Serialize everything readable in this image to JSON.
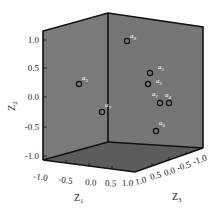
{
  "chart_data": {
    "type": "scatter",
    "subtype": "3d-scatter",
    "title": "",
    "axes": {
      "x": {
        "label": "Z1",
        "label_main": "Z",
        "label_sub": "1",
        "ticks": [
          "-1.0",
          "-0.5",
          "0.0",
          "0.5",
          "1.0"
        ],
        "range": [
          -1.0,
          1.0
        ]
      },
      "y": {
        "label": "Z2",
        "label_main": "Z",
        "label_sub": "2",
        "ticks": [
          "1.0",
          "0.5",
          "0.0",
          "-0.5",
          "-1.0"
        ],
        "range": [
          -1.0,
          1.0
        ]
      },
      "z": {
        "label": "Z3",
        "label_main": "Z",
        "label_sub": "3",
        "ticks": [
          "1.0",
          "0.5",
          "0.0",
          "-0.5",
          "-1.0"
        ],
        "range": [
          -1.0,
          1.0
        ]
      }
    },
    "points": [
      {
        "label": "a9",
        "main": "a",
        "sub": "9",
        "px": 127,
        "py": 41,
        "lx": 130,
        "ly": 38,
        "z2": 1.0
      },
      {
        "label": "a3",
        "main": "a",
        "sub": "3",
        "px": 79,
        "py": 84,
        "lx": 82,
        "ly": 80,
        "z2": 0.25
      },
      {
        "label": "a7",
        "main": "a",
        "sub": "7",
        "px": 102,
        "py": 112,
        "lx": 105,
        "ly": 107,
        "z2": -0.25
      },
      {
        "label": "a5",
        "main": "a",
        "sub": "5",
        "px": 150,
        "py": 73,
        "lx": 158,
        "ly": 69,
        "z2": 0.4
      },
      {
        "label": "a2",
        "main": "a",
        "sub": "2",
        "px": 148,
        "py": 84,
        "lx": 156,
        "ly": 83,
        "z2": 0.2
      },
      {
        "label": "a1",
        "main": "a",
        "sub": "1",
        "px": 160,
        "py": 103,
        "lx": 152,
        "ly": 96,
        "z2": -0.1
      },
      {
        "label": "a4",
        "main": "a",
        "sub": "4",
        "px": 169,
        "py": 103,
        "lx": 165,
        "ly": 97,
        "z2": -0.1
      },
      {
        "label": "a6",
        "main": "a",
        "sub": "6",
        "px": 156,
        "py": 131,
        "lx": 159,
        "ly": 125,
        "z2": -0.55
      }
    ],
    "grid": false,
    "legend": null,
    "colors": {
      "wall": "#7a7a7a",
      "floor": "#5c5c5c",
      "edge": "#111111",
      "marker": "#111111",
      "label": "#ffffff"
    }
  }
}
